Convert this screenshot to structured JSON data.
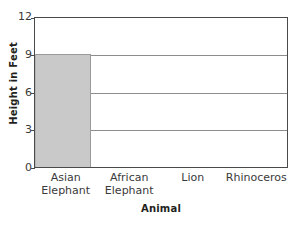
{
  "chart_data": {
    "type": "bar",
    "title": "",
    "xlabel": "Animal",
    "ylabel": "Height in Feet",
    "categories": [
      "Asian Elephant",
      "African Elephant",
      "Lion",
      "Rhinoceros"
    ],
    "category_lines": [
      [
        "Asian",
        "Elephant"
      ],
      [
        "African",
        "Elephant"
      ],
      [
        "Lion"
      ],
      [
        "Rhinoceros"
      ]
    ],
    "values": [
      9,
      null,
      null,
      null
    ],
    "ylim": [
      0,
      12
    ],
    "yticks": [
      0,
      3,
      6,
      9,
      12
    ],
    "ytick_labels": [
      "0",
      "3",
      "6",
      "9",
      "12"
    ],
    "grid": "horizontal",
    "legend": "none",
    "bar_color": "#c9c9c9",
    "frame_color": "#4a4a4a",
    "grid_color": "#8d8d8d"
  },
  "axes": {
    "y_title": "Height in Feet",
    "x_title": "Animal"
  }
}
